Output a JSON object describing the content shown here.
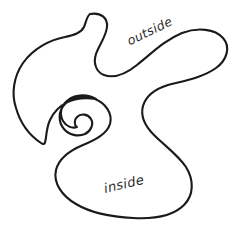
{
  "figure": {
    "type": "closed-curve-diagram",
    "background_color": "#ffffff",
    "stroke_color": "#1a1a1a",
    "stroke_width": 2.1,
    "label_color": "#2b2b2b",
    "canvas": {
      "width": 240,
      "height": 230
    }
  },
  "labels": {
    "outside": {
      "text": "outside",
      "rotation_deg": -26,
      "x": 128,
      "y": 36,
      "font_size": 12.5
    },
    "inside": {
      "text": "inside",
      "rotation_deg": -13,
      "x": 104,
      "y": 182,
      "font_size": 13
    }
  },
  "curve": {
    "closed": true,
    "path": "M 90 14 C 101 12 108 18 107 27 C 106 37 99 45 96 54 C 93 63 96 72 104 75 C 115 79 127 73 137 65 C 152 53 165 40 182 33 C 198 27 215 29 223 38 C 231 47 227 60 216 68 C 202 78 183 81 168 85 C 155 89 146 96 143 106 C 140 117 146 127 154 135 C 165 146 178 155 186 167 C 194 180 194 195 184 205 C 172 217 151 219 133 218 C 112 217 91 213 76 204 C 62 196 53 183 56 170 C 59 158 71 150 83 145 C 95 140 107 134 110 124 C 113 113 105 103 95 99 C 84 95 72 97 65 104 C 58 111 58 122 64 129 C 69 135 78 137 85 134 C 91 131 94 124 91 119 C 88 114 81 113 77 117 C 74 120 74 125 77 127 C 72 129 66 126 63 121 C 59 114 61 105 68 100 C 76 94 88 94 96 99 C 73 95 57 105 50 120 C 44 133 48 148 41 143 C 29 135 20 122 16 108 C 11 93 14 76 23 63 C 33 49 49 40 65 37 C 74 35 81 33 84 27 C 86 22 87 16 90 14 Z"
  }
}
